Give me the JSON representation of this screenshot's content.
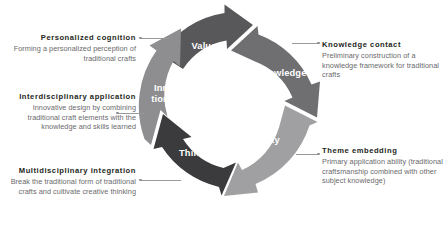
{
  "diagram": {
    "type": "cycle",
    "orientation": "clockwise",
    "segment_count": 5,
    "center": {
      "x": 228,
      "y": 107
    },
    "segments": [
      {
        "id": "value",
        "label": "Value",
        "color": "#58585a",
        "order": 1,
        "angle_start": -108,
        "angle_end": -28
      },
      {
        "id": "knowledge",
        "label": "Knowledge",
        "color": "#6f6f72",
        "order": 2,
        "angle_start": -26,
        "angle_end": 46
      },
      {
        "id": "ability",
        "label": "Ability",
        "color": "#a0a0a3",
        "order": 3,
        "angle_start": 48,
        "angle_end": 124
      },
      {
        "id": "thinking",
        "label": "Thinking",
        "color": "#3b3b3d",
        "order": 4,
        "angle_start": 126,
        "angle_end": 196
      },
      {
        "id": "innovation",
        "label": "Innova-\ntion",
        "color": "#8e8e91",
        "order": 5,
        "angle_start": 198,
        "angle_end": 252,
        "label_line_1": "Innova-",
        "label_line_2": "tion"
      }
    ]
  },
  "annotations": {
    "personalized_cognition": {
      "title": "Personalized cognition",
      "body": "Forming a personalized perception of traditional crafts",
      "side": "left",
      "links_to": "value"
    },
    "interdisciplinary_application": {
      "title": "Interdisciplinary application",
      "body": "Innovative design by combining traditional craft elements with the knowledge and skills learned",
      "side": "left",
      "links_to": "innovation"
    },
    "multidisciplinary_integration": {
      "title": "Multidisciplinary integration",
      "body": "Break the traditional form of traditional crafts and cultivate creative thinking",
      "side": "left",
      "links_to": "thinking"
    },
    "knowledge_contact": {
      "title": "Knowledge contact",
      "body": "Preliminary construction of a knowledge framework for traditional crafts",
      "side": "right",
      "links_to": "knowledge"
    },
    "theme_embedding": {
      "title": "Theme embedding",
      "body": "Primary application ability (traditional craftsmanship combined with other subject knowledge)",
      "side": "right",
      "links_to": "ability"
    }
  },
  "style": {
    "background": "#ffffff",
    "title_color": "#231f20",
    "body_color": "#6a6a6d",
    "connector_color": "#9a9a9d",
    "segment_label_color": "#ffffff"
  }
}
